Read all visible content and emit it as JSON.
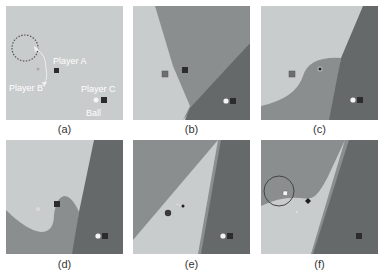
{
  "colors": {
    "light": "#c9cccc",
    "mid": "#8b8e8e",
    "dark": "#66696a",
    "marker_dark": "#2c2c2c",
    "marker_grey": "#6e6e6e",
    "ball": "#f4f4f4",
    "path": "#e8e8e8"
  },
  "panels": [
    {
      "caption": "(a)",
      "labels": {
        "player_a": "Player A",
        "player_b": "Player B",
        "player_c": "Player C",
        "ball": "Ball"
      }
    },
    {
      "caption": "(b)"
    },
    {
      "caption": "(c)"
    },
    {
      "caption": "(d)"
    },
    {
      "caption": "(e)"
    },
    {
      "caption": "(f)"
    }
  ]
}
